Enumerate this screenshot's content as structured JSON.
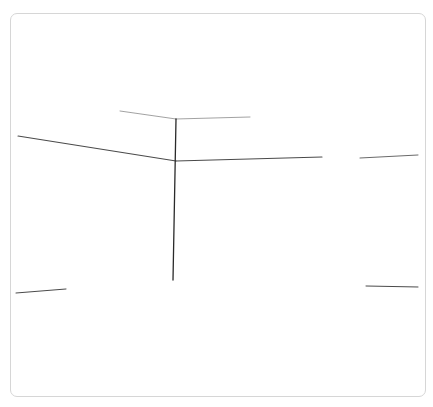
{
  "sketch": {
    "description": "hand-drawn perspective sketch of a room corner",
    "stroke_color": "#2a2a2a",
    "light_stroke_color": "#8a8a8a",
    "border_color": "#d6d6d6",
    "strokes": [
      {
        "name": "ceiling-left-edge",
        "x1": 120,
        "y1": 111,
        "x2": 176,
        "y2": 119,
        "width": 0.8,
        "color": "#8a8a8a"
      },
      {
        "name": "ceiling-right-edge",
        "x1": 176,
        "y1": 119,
        "x2": 250,
        "y2": 117,
        "width": 0.8,
        "color": "#8a8a8a"
      },
      {
        "name": "wall-left-edge",
        "x1": 18,
        "y1": 136,
        "x2": 176,
        "y2": 161,
        "width": 1.1,
        "color": "#4a4a4a"
      },
      {
        "name": "wall-right-edge",
        "x1": 176,
        "y1": 161,
        "x2": 322,
        "y2": 157,
        "width": 1.1,
        "color": "#4a4a4a"
      },
      {
        "name": "far-right-edge",
        "x1": 360,
        "y1": 158,
        "x2": 418,
        "y2": 155,
        "width": 1.0,
        "color": "#6a6a6a"
      },
      {
        "name": "corner-vertical",
        "x1": 176,
        "y1": 119,
        "x2": 173,
        "y2": 280,
        "width": 1.3,
        "color": "#2a2a2a"
      },
      {
        "name": "floor-left-edge",
        "x1": 16,
        "y1": 293,
        "x2": 66,
        "y2": 289,
        "width": 1.0,
        "color": "#4a4a4a"
      },
      {
        "name": "floor-right-edge",
        "x1": 366,
        "y1": 286,
        "x2": 418,
        "y2": 287,
        "width": 1.0,
        "color": "#4a4a4a"
      }
    ]
  }
}
